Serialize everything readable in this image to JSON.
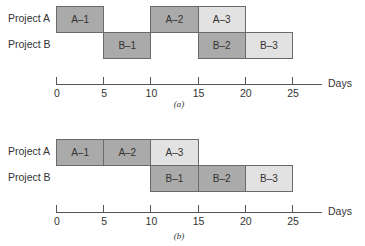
{
  "chart_data": [
    {
      "type": "gantt",
      "caption": "(a)",
      "rows": [
        "Project A",
        "Project B"
      ],
      "xlabel": "Days",
      "xticks": [
        0,
        5,
        10,
        15,
        20,
        25
      ],
      "xlim": [
        0,
        28
      ],
      "tasks": [
        {
          "label": "A–1",
          "row": "Project A",
          "start": 0,
          "end": 5,
          "shade": "dark"
        },
        {
          "label": "B–1",
          "row": "Project B",
          "start": 5,
          "end": 10,
          "shade": "dark"
        },
        {
          "label": "A–2",
          "row": "Project A",
          "start": 10,
          "end": 15,
          "shade": "dark"
        },
        {
          "label": "A–3",
          "row": "Project A",
          "start": 15,
          "end": 20,
          "shade": "light"
        },
        {
          "label": "B–2",
          "row": "Project B",
          "start": 15,
          "end": 20,
          "shade": "dark"
        },
        {
          "label": "B–3",
          "row": "Project B",
          "start": 20,
          "end": 25,
          "shade": "light"
        }
      ]
    },
    {
      "type": "gantt",
      "caption": "(b)",
      "rows": [
        "Project A",
        "Project B"
      ],
      "xlabel": "Days",
      "xticks": [
        0,
        5,
        10,
        15,
        20,
        25
      ],
      "xlim": [
        0,
        28
      ],
      "tasks": [
        {
          "label": "A–1",
          "row": "Project A",
          "start": 0,
          "end": 5,
          "shade": "dark"
        },
        {
          "label": "A–2",
          "row": "Project A",
          "start": 5,
          "end": 10,
          "shade": "dark"
        },
        {
          "label": "A–3",
          "row": "Project A",
          "start": 10,
          "end": 15,
          "shade": "light"
        },
        {
          "label": "B–1",
          "row": "Project B",
          "start": 10,
          "end": 15,
          "shade": "dark"
        },
        {
          "label": "B–2",
          "row": "Project B",
          "start": 15,
          "end": 20,
          "shade": "dark"
        },
        {
          "label": "B–3",
          "row": "Project B",
          "start": 20,
          "end": 25,
          "shade": "light"
        }
      ]
    }
  ],
  "colors": {
    "dark": "#aaaaaa",
    "light": "#e2e2e2",
    "border": "#6a6a6a",
    "axis": "#555555"
  }
}
